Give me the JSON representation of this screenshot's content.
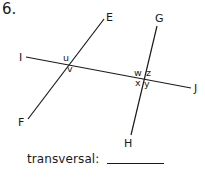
{
  "problem": {
    "number": "6.",
    "prompt_label": "transversal:",
    "answer_value": ""
  },
  "diagram": {
    "lines": [
      {
        "id": "IJ",
        "from": "I",
        "to": "J",
        "x1": 26,
        "y1": 57,
        "x2": 191,
        "y2": 88
      },
      {
        "id": "EF",
        "from": "E",
        "to": "F",
        "x1": 104,
        "y1": 19,
        "x2": 28,
        "y2": 119
      },
      {
        "id": "GH",
        "from": "G",
        "to": "H",
        "x1": 157,
        "y1": 26,
        "x2": 131,
        "y2": 135
      }
    ],
    "point_labels": {
      "E": "E",
      "F": "F",
      "G": "G",
      "H": "H",
      "I": "I",
      "J": "J"
    },
    "angle_labels": {
      "u": "u",
      "v": "v",
      "w": "w",
      "x": "x",
      "y": "y",
      "z": "z"
    },
    "stroke_color": "#1a1a1a"
  }
}
